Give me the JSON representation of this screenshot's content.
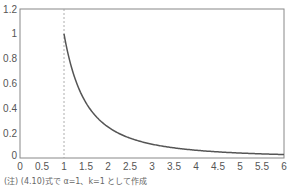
{
  "chart_data": {
    "type": "line",
    "title": "",
    "xlabel": "",
    "ylabel": "",
    "xlim": [
      0,
      6
    ],
    "ylim": [
      0,
      1.2
    ],
    "x_ticks": [
      "0",
      "0.5",
      "1",
      "1.5",
      "2",
      "2.5",
      "3",
      "3.5",
      "4",
      "4.5",
      "5",
      "5.5",
      "6"
    ],
    "y_ticks": [
      "0",
      "0.2",
      "0.4",
      "0.6",
      "0.8",
      "1",
      "1.2"
    ],
    "grid": false,
    "legend": null,
    "series": [
      {
        "name": "f(x)=1/x^2",
        "x": [
          1,
          1.25,
          1.5,
          1.75,
          2,
          2.5,
          3,
          3.5,
          4,
          4.5,
          5,
          5.5,
          6
        ],
        "values": [
          1,
          0.64,
          0.444,
          0.327,
          0.25,
          0.16,
          0.111,
          0.082,
          0.0625,
          0.049,
          0.04,
          0.033,
          0.028
        ]
      }
    ],
    "annotations": [
      {
        "type": "vertical-dashed-line",
        "x": 1
      }
    ],
    "colors": {
      "curve": "#555555",
      "axis": "#888888",
      "dashed": "#999999"
    }
  },
  "footnote": "(注) (4.10)式で α=1、k=1 として作成"
}
